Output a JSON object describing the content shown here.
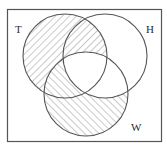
{
  "diagram": {
    "type": "venn",
    "universe_frame": {
      "x": 7,
      "y": 9,
      "width": 155,
      "height": 133,
      "stroke": "#555555"
    },
    "sets": [
      {
        "id": "T",
        "label": "T",
        "cx": 65,
        "cy": 56,
        "r": 42,
        "label_x": 15,
        "label_y": 33
      },
      {
        "id": "H",
        "label": "H",
        "cx": 105,
        "cy": 56,
        "r": 42,
        "label_x": 146,
        "label_y": 33
      },
      {
        "id": "W",
        "label": "W",
        "cx": 86,
        "cy": 94,
        "r": 42,
        "label_x": 131,
        "label_y": 131
      }
    ],
    "shaded_regions": [
      "T only",
      "T∩H only",
      "T∩W only",
      "W only"
    ],
    "unshaded_regions": [
      "H only",
      "H∩W only",
      "T∩H∩W",
      "outside"
    ],
    "shaded_expression": "(T ∪ W) − (H ∩ W)",
    "hatch": {
      "T_direction": "\\",
      "W_direction": "/",
      "color": "#777777"
    },
    "stroke_color": "#555555"
  }
}
